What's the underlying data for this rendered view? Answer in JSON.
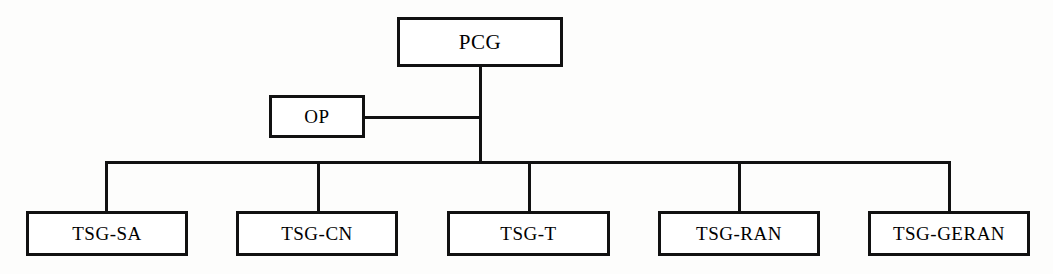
{
  "diagram": {
    "type": "organizational-chart",
    "orientation": "top-down",
    "line_color": "#111111",
    "box_fill": "#ffffff",
    "background": "#fdfdfc",
    "nodes": [
      {
        "id": "pcg",
        "label": "PCG",
        "level": 0,
        "x": 397,
        "y": 17,
        "w": 166,
        "h": 50,
        "font_size": 21
      },
      {
        "id": "op",
        "label": "OP",
        "level": 1,
        "x": 269,
        "y": 95,
        "w": 96,
        "h": 43,
        "font_size": 19
      },
      {
        "id": "tsg-sa",
        "label": "TSG-SA",
        "level": 2,
        "x": 26,
        "y": 211,
        "w": 162,
        "h": 45,
        "font_size": 19
      },
      {
        "id": "tsg-cn",
        "label": "TSG-CN",
        "level": 2,
        "x": 236,
        "y": 211,
        "w": 162,
        "h": 45,
        "font_size": 19
      },
      {
        "id": "tsg-t",
        "label": "TSG-T",
        "level": 2,
        "x": 447,
        "y": 211,
        "w": 163,
        "h": 45,
        "font_size": 19
      },
      {
        "id": "tsg-ran",
        "label": "TSG-RAN",
        "level": 2,
        "x": 658,
        "y": 211,
        "w": 162,
        "h": 45,
        "font_size": 19
      },
      {
        "id": "tsg-geran",
        "label": "TSG-GERAN",
        "level": 2,
        "x": 868,
        "y": 211,
        "w": 162,
        "h": 45,
        "font_size": 19
      }
    ],
    "edges": [
      {
        "from": "pcg",
        "to": "trunk",
        "kind": "vertical"
      },
      {
        "from": "op",
        "to": "trunk",
        "kind": "horizontal"
      },
      {
        "from": "trunk",
        "to": "bus",
        "kind": "vertical"
      },
      {
        "from": "bus",
        "to": "tsg-sa",
        "kind": "drop"
      },
      {
        "from": "bus",
        "to": "tsg-cn",
        "kind": "drop"
      },
      {
        "from": "bus",
        "to": "tsg-t",
        "kind": "drop"
      },
      {
        "from": "bus",
        "to": "tsg-ran",
        "kind": "drop"
      },
      {
        "from": "bus",
        "to": "tsg-geran",
        "kind": "drop"
      }
    ],
    "geometry": {
      "trunk_x": 479,
      "trunk_top": 67,
      "op_junction_y": 117,
      "bus_y": 161,
      "bus_left": 105,
      "bus_right": 948,
      "drop_bottom": 211,
      "drops": [
        105,
        317,
        528,
        738,
        948
      ],
      "op_right": 365,
      "stroke": 3
    }
  }
}
